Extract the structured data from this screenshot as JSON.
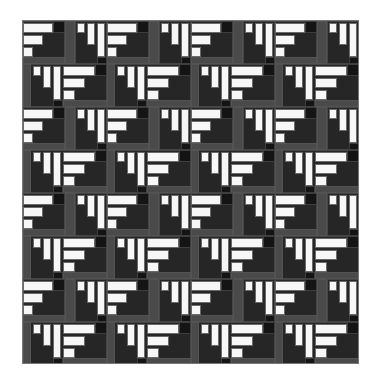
{
  "colors": {
    "white": "#f7f7f7",
    "mid_gray": "#4a4a4a",
    "dark": "#262626",
    "darker": "#141414",
    "outline": "#777777"
  },
  "grid": {
    "left": 22,
    "top": 20,
    "width": 337,
    "height": 344,
    "repeat_x": 84,
    "repeat_y": 86,
    "cols": 5,
    "rows": 4
  },
  "tile": [
    {
      "x": 0,
      "y": 0,
      "w": 42,
      "h": 43,
      "c": "dark"
    },
    {
      "x": 0,
      "y": 2,
      "w": 30,
      "h": 10,
      "c": "white"
    },
    {
      "x": 0,
      "y": 14,
      "w": 20,
      "h": 10,
      "c": "white"
    },
    {
      "x": 0,
      "y": 26,
      "w": 10,
      "h": 10,
      "c": "white"
    },
    {
      "x": 30,
      "y": 0,
      "w": 12,
      "h": 12,
      "c": "darker"
    },
    {
      "x": 0,
      "y": 36,
      "w": 42,
      "h": 7,
      "c": "mid_gray"
    },
    {
      "x": 42,
      "y": 0,
      "w": 10,
      "h": 43,
      "c": "mid_gray"
    },
    {
      "x": 52,
      "y": 0,
      "w": 32,
      "h": 43,
      "c": "dark"
    },
    {
      "x": 54,
      "y": 2,
      "w": 8,
      "h": 10,
      "c": "white"
    },
    {
      "x": 64,
      "y": 2,
      "w": 8,
      "h": 22,
      "c": "white"
    },
    {
      "x": 74,
      "y": 2,
      "w": 8,
      "h": 34,
      "c": "white"
    },
    {
      "x": 74,
      "y": 36,
      "w": 10,
      "h": 7,
      "c": "darker"
    },
    {
      "x": 0,
      "y": 43,
      "w": 84,
      "h": 43,
      "c": "dark"
    },
    {
      "x": 0,
      "y": 43,
      "w": 8,
      "h": 43,
      "c": "mid_gray"
    },
    {
      "x": 10,
      "y": 45,
      "w": 8,
      "h": 10,
      "c": "white"
    },
    {
      "x": 20,
      "y": 45,
      "w": 8,
      "h": 22,
      "c": "white"
    },
    {
      "x": 30,
      "y": 45,
      "w": 8,
      "h": 34,
      "c": "white"
    },
    {
      "x": 40,
      "y": 45,
      "w": 32,
      "h": 10,
      "c": "white"
    },
    {
      "x": 40,
      "y": 57,
      "w": 22,
      "h": 10,
      "c": "white"
    },
    {
      "x": 40,
      "y": 69,
      "w": 12,
      "h": 10,
      "c": "white"
    },
    {
      "x": 72,
      "y": 43,
      "w": 12,
      "h": 12,
      "c": "darker"
    },
    {
      "x": 40,
      "y": 79,
      "w": 44,
      "h": 7,
      "c": "mid_gray"
    },
    {
      "x": 30,
      "y": 79,
      "w": 10,
      "h": 7,
      "c": "darker"
    }
  ]
}
